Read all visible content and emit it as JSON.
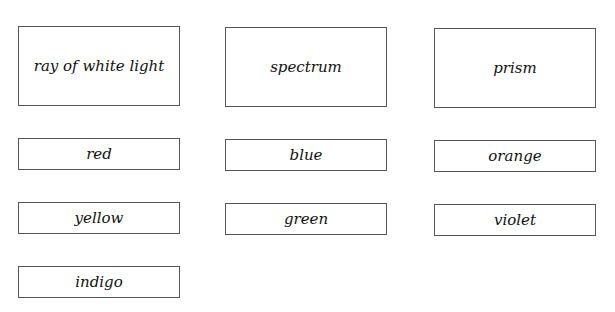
{
  "cards": [
    {
      "label": "ray of white light"
    },
    {
      "label": "spectrum"
    },
    {
      "label": "prism"
    },
    {
      "label": "red"
    },
    {
      "label": "blue"
    },
    {
      "label": "orange"
    },
    {
      "label": "yellow"
    },
    {
      "label": "green"
    },
    {
      "label": "violet"
    },
    {
      "label": "indigo"
    }
  ]
}
